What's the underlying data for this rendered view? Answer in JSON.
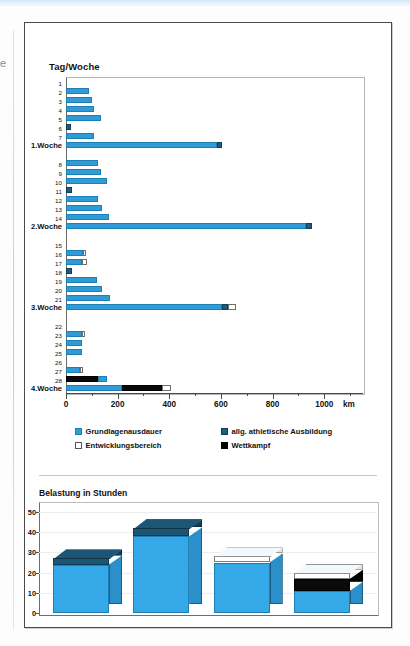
{
  "figure": {
    "top_chart_title": "Tag/Woche",
    "bottom_chart_title": "Belastung in Stunden",
    "x_unit": "km"
  },
  "legend": {
    "items": [
      {
        "key": "grundlagenausdauer",
        "label": "Grundlagenausdauer",
        "color": "#2f9bd7"
      },
      {
        "key": "athletik",
        "label": "allg. athletische Ausbildung",
        "color": "#1d5c7e"
      },
      {
        "key": "entwicklungsbereich",
        "label": "Entwicklungsbereich",
        "color": "#ffffff"
      },
      {
        "key": "wettkampf",
        "label": "Wettkampf",
        "color": "#000000"
      }
    ]
  },
  "chart_data": [
    {
      "type": "bar",
      "orientation": "horizontal",
      "stacked": true,
      "title": "Tag/Woche",
      "xlabel": "km",
      "ylabel": "Tag/Woche",
      "xlim": [
        0,
        1150
      ],
      "xticks": [
        0,
        200,
        400,
        600,
        800,
        1000
      ],
      "xtick_labels": [
        "0",
        "200",
        "400",
        "600",
        "800",
        "1000"
      ],
      "minor_xticks": [
        100,
        300,
        500,
        700,
        900,
        1100
      ],
      "grid": false,
      "legend_position": "below",
      "series": [
        {
          "name": "Grundlagenausdauer",
          "color": "#2f9bd7"
        },
        {
          "name": "allg. athletische Ausbildung",
          "color": "#1d5c7e"
        },
        {
          "name": "Entwicklungsbereich",
          "color": "#ffffff"
        },
        {
          "name": "Wettkampf",
          "color": "#000000"
        }
      ],
      "categories": [
        "1",
        "2",
        "3",
        "4",
        "5",
        "6",
        "7",
        "1.Woche",
        "8",
        "9",
        "10",
        "11",
        "12",
        "13",
        "14",
        "2.Woche",
        "15",
        "16",
        "17",
        "18",
        "19",
        "20",
        "21",
        "3.Woche",
        "22",
        "23",
        "24",
        "25",
        "26",
        "27",
        "28",
        "4.Woche"
      ],
      "rows": [
        {
          "label": "1",
          "week_total": false,
          "gap_before": 0,
          "grundlagenausdauer": 0,
          "athletik": 0,
          "entwicklungsbereich": 0,
          "wettkampf": 0
        },
        {
          "label": "2",
          "week_total": false,
          "gap_before": 0,
          "grundlagenausdauer": 90,
          "athletik": 0,
          "entwicklungsbereich": 0,
          "wettkampf": 0
        },
        {
          "label": "3",
          "week_total": false,
          "gap_before": 0,
          "grundlagenausdauer": 100,
          "athletik": 0,
          "entwicklungsbereich": 0,
          "wettkampf": 0
        },
        {
          "label": "4",
          "week_total": false,
          "gap_before": 0,
          "grundlagenausdauer": 110,
          "athletik": 0,
          "entwicklungsbereich": 0,
          "wettkampf": 0
        },
        {
          "label": "5",
          "week_total": false,
          "gap_before": 0,
          "grundlagenausdauer": 135,
          "athletik": 0,
          "entwicklungsbereich": 0,
          "wettkampf": 0
        },
        {
          "label": "6",
          "week_total": false,
          "gap_before": 0,
          "grundlagenausdauer": 0,
          "athletik": 20,
          "entwicklungsbereich": 0,
          "wettkampf": 0
        },
        {
          "label": "7",
          "week_total": false,
          "gap_before": 0,
          "grundlagenausdauer": 110,
          "athletik": 0,
          "entwicklungsbereich": 0,
          "wettkampf": 0
        },
        {
          "label": "1.Woche",
          "week_total": true,
          "gap_before": 0,
          "grundlagenausdauer": 585,
          "athletik": 20,
          "entwicklungsbereich": 0,
          "wettkampf": 0
        },
        {
          "label": "8",
          "week_total": false,
          "gap_before": 9,
          "grundlagenausdauer": 125,
          "athletik": 0,
          "entwicklungsbereich": 0,
          "wettkampf": 0
        },
        {
          "label": "9",
          "week_total": false,
          "gap_before": 0,
          "grundlagenausdauer": 135,
          "athletik": 0,
          "entwicklungsbereich": 0,
          "wettkampf": 0
        },
        {
          "label": "10",
          "week_total": false,
          "gap_before": 0,
          "grundlagenausdauer": 160,
          "athletik": 0,
          "entwicklungsbereich": 0,
          "wettkampf": 0
        },
        {
          "label": "11",
          "week_total": false,
          "gap_before": 0,
          "grundlagenausdauer": 0,
          "athletik": 22,
          "entwicklungsbereich": 0,
          "wettkampf": 0
        },
        {
          "label": "12",
          "week_total": false,
          "gap_before": 0,
          "grundlagenausdauer": 125,
          "athletik": 0,
          "entwicklungsbereich": 0,
          "wettkampf": 0
        },
        {
          "label": "13",
          "week_total": false,
          "gap_before": 0,
          "grundlagenausdauer": 140,
          "athletik": 0,
          "entwicklungsbereich": 0,
          "wettkampf": 0
        },
        {
          "label": "14",
          "week_total": false,
          "gap_before": 0,
          "grundlagenausdauer": 165,
          "athletik": 0,
          "entwicklungsbereich": 0,
          "wettkampf": 0
        },
        {
          "label": "2.Woche",
          "week_total": true,
          "gap_before": 0,
          "grundlagenausdauer": 930,
          "athletik": 22,
          "entwicklungsbereich": 0,
          "wettkampf": 0
        },
        {
          "label": "15",
          "week_total": false,
          "gap_before": 9,
          "grundlagenausdauer": 0,
          "athletik": 0,
          "entwicklungsbereich": 0,
          "wettkampf": 0
        },
        {
          "label": "16",
          "week_total": false,
          "gap_before": 0,
          "grundlagenausdauer": 65,
          "athletik": 0,
          "entwicklungsbereich": 12,
          "wettkampf": 0
        },
        {
          "label": "17",
          "week_total": false,
          "gap_before": 0,
          "grundlagenausdauer": 62,
          "athletik": 0,
          "entwicklungsbereich": 18,
          "wettkampf": 0
        },
        {
          "label": "18",
          "week_total": false,
          "gap_before": 0,
          "grundlagenausdauer": 0,
          "athletik": 22,
          "entwicklungsbereich": 0,
          "wettkampf": 0
        },
        {
          "label": "19",
          "week_total": false,
          "gap_before": 0,
          "grundlagenausdauer": 120,
          "athletik": 0,
          "entwicklungsbereich": 0,
          "wettkampf": 0
        },
        {
          "label": "20",
          "week_total": false,
          "gap_before": 0,
          "grundlagenausdauer": 140,
          "athletik": 0,
          "entwicklungsbereich": 0,
          "wettkampf": 0
        },
        {
          "label": "21",
          "week_total": false,
          "gap_before": 0,
          "grundlagenausdauer": 170,
          "athletik": 0,
          "entwicklungsbereich": 0,
          "wettkampf": 0
        },
        {
          "label": "3.Woche",
          "week_total": true,
          "gap_before": 0,
          "grundlagenausdauer": 605,
          "athletik": 22,
          "entwicklungsbereich": 30,
          "wettkampf": 0
        },
        {
          "label": "22",
          "week_total": false,
          "gap_before": 9,
          "grundlagenausdauer": 0,
          "athletik": 0,
          "entwicklungsbereich": 0,
          "wettkampf": 0
        },
        {
          "label": "23",
          "week_total": false,
          "gap_before": 0,
          "grundlagenausdauer": 62,
          "athletik": 0,
          "entwicklungsbereich": 12,
          "wettkampf": 0
        },
        {
          "label": "24",
          "week_total": false,
          "gap_before": 0,
          "grundlagenausdauer": 62,
          "athletik": 0,
          "entwicklungsbereich": 0,
          "wettkampf": 0
        },
        {
          "label": "25",
          "week_total": false,
          "gap_before": 0,
          "grundlagenausdauer": 62,
          "athletik": 0,
          "entwicklungsbereich": 0,
          "wettkampf": 0
        },
        {
          "label": "26",
          "week_total": false,
          "gap_before": 0,
          "grundlagenausdauer": 0,
          "athletik": 0,
          "entwicklungsbereich": 0,
          "wettkampf": 0
        },
        {
          "label": "27",
          "week_total": false,
          "gap_before": 0,
          "grundlagenausdauer": 55,
          "athletik": 0,
          "entwicklungsbereich": 10,
          "wettkampf": 0
        },
        {
          "label": "28",
          "week_total": false,
          "gap_before": 0,
          "grundlagenausdauer": 0,
          "athletik": 0,
          "entwicklungsbereich": 0,
          "wettkampf": 125,
          "gla_after_wettkampf": 35
        },
        {
          "label": "4.Woche",
          "week_total": true,
          "gap_before": 0,
          "grundlagenausdauer": 215,
          "athletik": 0,
          "entwicklungsbereich": 35,
          "wettkampf": 155
        }
      ]
    },
    {
      "type": "bar",
      "orientation": "vertical",
      "stacked": true,
      "three_d": true,
      "title": "Belastung in Stunden",
      "xlabel": "",
      "ylabel": "Belastung in Stunden",
      "ylim": [
        0,
        50
      ],
      "yticks": [
        0,
        10,
        20,
        30,
        40,
        50
      ],
      "ytick_labels": [
        "0",
        "10",
        "20",
        "30",
        "40",
        "50"
      ],
      "grid": false,
      "legend_position": "none",
      "categories": [
        "1.Woche",
        "2.Woche",
        "3.Woche",
        "4.Woche"
      ],
      "series": [
        {
          "name": "Grundlagenausdauer",
          "color": "#35a8e8",
          "values": [
            24,
            38,
            25,
            11
          ]
        },
        {
          "name": "allg. athletische Ausbildung",
          "color": "#1b5775",
          "values": [
            3,
            4,
            0,
            0
          ]
        },
        {
          "name": "Wettkampf",
          "color": "#0a0a0a",
          "values": [
            0,
            0,
            0,
            6
          ]
        },
        {
          "name": "Entwicklungsbereich",
          "color": "#ffffff",
          "values": [
            0,
            0,
            3,
            3
          ]
        }
      ]
    }
  ]
}
